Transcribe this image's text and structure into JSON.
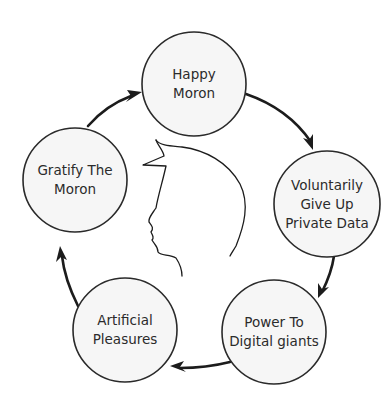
{
  "diagram": {
    "type": "cycle",
    "nodes": [
      {
        "id": "happy-moron",
        "lines": [
          "Happy",
          "Moron"
        ]
      },
      {
        "id": "voluntarily-give-up-private-data",
        "lines": [
          "Voluntarily",
          "Give Up",
          "Private Data"
        ]
      },
      {
        "id": "power-to-digital-giants",
        "lines": [
          "Power To",
          "Digital giants"
        ]
      },
      {
        "id": "artificial-pleasures",
        "lines": [
          "Artificial",
          "Pleasures"
        ]
      },
      {
        "id": "gratify-the-moron",
        "lines": [
          "Gratify The",
          "Moron"
        ]
      }
    ],
    "edges": [
      {
        "from": "happy-moron",
        "to": "voluntarily-give-up-private-data"
      },
      {
        "from": "voluntarily-give-up-private-data",
        "to": "power-to-digital-giants"
      },
      {
        "from": "power-to-digital-giants",
        "to": "artificial-pleasures"
      },
      {
        "from": "artificial-pleasures",
        "to": "gratify-the-moron"
      },
      {
        "from": "gratify-the-moron",
        "to": "happy-moron"
      }
    ],
    "center_illustration": "head-profile-silhouette",
    "colors": {
      "node_fill": "#f6f6f6",
      "stroke": "#1c1c1c",
      "text": "#2b2b2b"
    }
  }
}
